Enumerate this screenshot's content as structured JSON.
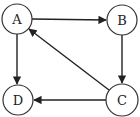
{
  "diagram": {
    "type": "directed-graph",
    "nodes": [
      {
        "id": "A",
        "label": "A",
        "x": 17,
        "y": 19,
        "r": 15
      },
      {
        "id": "B",
        "label": "B",
        "x": 122,
        "y": 20,
        "r": 15
      },
      {
        "id": "C",
        "label": "C",
        "x": 122,
        "y": 100,
        "r": 16
      },
      {
        "id": "D",
        "label": "D",
        "x": 18,
        "y": 100,
        "r": 15
      }
    ],
    "edges": [
      {
        "from": "A",
        "to": "B"
      },
      {
        "from": "B",
        "to": "C"
      },
      {
        "from": "C",
        "to": "A"
      },
      {
        "from": "A",
        "to": "D"
      },
      {
        "from": "C",
        "to": "D"
      }
    ],
    "colors": {
      "stroke": "#222222",
      "background": "#ffffff"
    }
  }
}
